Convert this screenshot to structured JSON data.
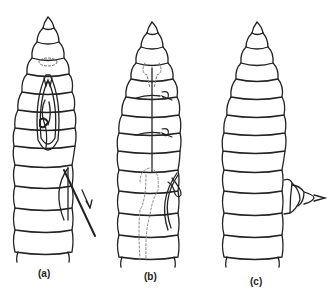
{
  "figure": {
    "panels": [
      {
        "id": "a",
        "label": "(a)",
        "description": "Worm with dorsal incision showing internal structures; arrow indicating direction along body"
      },
      {
        "id": "b",
        "label": "(b)",
        "description": "Worm with dashed internal organs and sutures; small protruding bud"
      },
      {
        "id": "c",
        "label": "(c)",
        "description": "Worm with lateral outgrowth regenerating segmented tip"
      }
    ],
    "colors": {
      "stroke": "#222222",
      "dashed": "#888888",
      "background": "#ffffff"
    }
  }
}
